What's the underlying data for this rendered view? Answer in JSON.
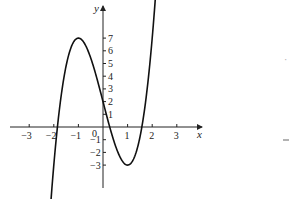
{
  "chart_data": {
    "type": "line",
    "title": "",
    "xlabel": "x",
    "ylabel": "y",
    "function": "y = 2.5x^3 - 7.5x + 2",
    "xlim": [
      -3.8,
      3.9
    ],
    "ylim": [
      -4.8,
      9.3
    ],
    "x_ticks": [
      -3,
      -2,
      -1,
      1,
      2,
      3
    ],
    "x_tick_labels": [
      "-3",
      "-2",
      "-1",
      "1",
      "2",
      "3"
    ],
    "y_ticks": [
      1,
      2,
      3,
      4,
      5,
      6,
      7,
      -1,
      -2,
      -3
    ],
    "y_tick_labels": [
      "1",
      "2",
      "3",
      "4",
      "5",
      "6",
      "7",
      "-1",
      "-2",
      "-3"
    ],
    "origin_label": "0",
    "grid": false,
    "legend": null,
    "key_points": [
      {
        "x": -1,
        "y": 7,
        "note": "local maximum"
      },
      {
        "x": 1,
        "y": -3,
        "note": "local minimum"
      },
      {
        "x": 0,
        "y": 2,
        "note": "y-intercept"
      }
    ],
    "domain_plotted": [
      -2.2,
      2.65
    ]
  }
}
